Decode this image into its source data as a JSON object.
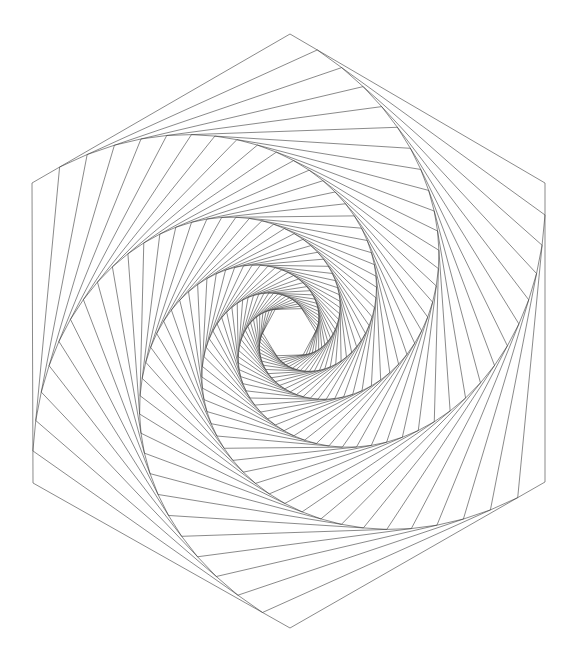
{
  "canvas": {
    "width": 570,
    "height": 661,
    "background": "#ffffff",
    "title": "Whirling Hexagons Spiral"
  },
  "figure": {
    "name": "whirling-hexagon-spiral",
    "stroke_color": "#3a3a3a",
    "stroke_width": 0.6,
    "fill": "none",
    "sides": 6,
    "iterations": 48,
    "step_ratio": 0.107,
    "direction": "counterclockwise-inward",
    "center": {
      "x": 288.5,
      "y": 332.5
    },
    "spiral_focus": {
      "x": 289,
      "y": 320
    },
    "outer_polygon_vertices": [
      {
        "x": 290,
        "y": 34
      },
      {
        "x": 545,
        "y": 183
      },
      {
        "x": 545,
        "y": 482
      },
      {
        "x": 290,
        "y": 628
      },
      {
        "x": 33,
        "y": 483
      },
      {
        "x": 32,
        "y": 183
      }
    ]
  },
  "chart_data": {
    "type": "line",
    "xlabel": "",
    "ylabel": "",
    "series": [
      {
        "name": "nested-hexagons",
        "note": "Each hexagon is inscribed in the previous one by dividing every edge at ratio 0.107 from its start vertex."
      }
    ]
  }
}
